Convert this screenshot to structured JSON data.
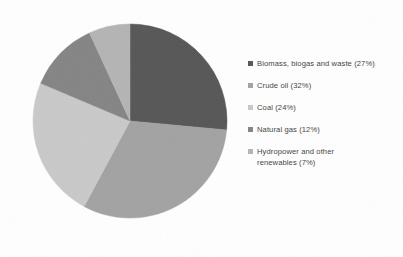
{
  "chart_data": {
    "type": "pie",
    "title": "",
    "subtitle": "",
    "xlabel": "",
    "ylabel": "",
    "grid": false,
    "legend_position": "right",
    "start_angle_deg": 0,
    "direction": "clockwise",
    "categories": [
      "Biomass, biogas and waste",
      "Crude oil",
      "Coal",
      "Natural gas",
      "Hydropower and other renewables"
    ],
    "values": [
      27,
      32,
      24,
      12,
      7
    ],
    "value_unit": "%",
    "colors": [
      "#565656",
      "#a2a2a2",
      "#c9c9c9",
      "#848484",
      "#b4b4b4"
    ],
    "slices": [
      {
        "label": "Biomass, biogas and waste",
        "value": 27,
        "color": "#565656"
      },
      {
        "label": "Crude oil",
        "value": 32,
        "color": "#a2a2a2"
      },
      {
        "label": "Coal",
        "value": 24,
        "color": "#c9c9c9"
      },
      {
        "label": "Natural gas",
        "value": 12,
        "color": "#848484"
      },
      {
        "label": "Hydropower and other renewables",
        "value": 7,
        "color": "#b4b4b4"
      }
    ]
  },
  "legend": {
    "items": [
      {
        "label": "Biomass, biogas and waste (27%)",
        "color": "#565656"
      },
      {
        "label": "Crude oil (32%)",
        "color": "#a2a2a2"
      },
      {
        "label": "Coal (24%)",
        "color": "#c9c9c9"
      },
      {
        "label": "Natural gas (12%)",
        "color": "#848484"
      },
      {
        "label": "Hydropower and other\nrenewables (7%)",
        "color": "#b4b4b4"
      }
    ]
  },
  "geometry": {
    "center_x": 100,
    "center_y": 107,
    "radius": 97
  },
  "background_color": "#ffffff"
}
